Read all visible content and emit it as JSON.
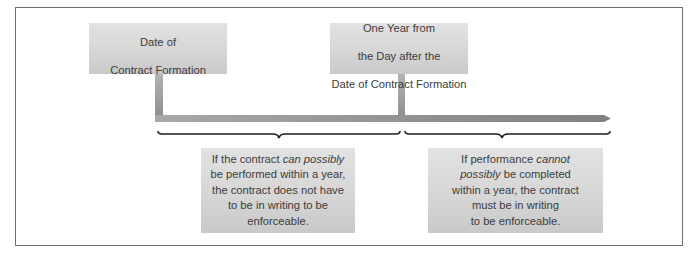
{
  "diagram": {
    "colors": {
      "frame_border": "#6e6e6e",
      "box_fill_top": "#e2e2e2",
      "box_fill_bottom": "#c9c9c9",
      "timeline": "#8c8c8c",
      "brace": "#1e1e1e",
      "text": "#3c3c3c"
    },
    "markers": [
      {
        "id": "start",
        "lines": [
          "Date of",
          "Contract Formation"
        ]
      },
      {
        "id": "one-year",
        "lines": [
          "One Year from",
          "the Day after the",
          "Date of Contract Formation"
        ]
      }
    ],
    "outcomes": [
      {
        "id": "within-year",
        "segments": [
          {
            "text": "If the contract ",
            "italic": false
          },
          {
            "text": "can possibly",
            "italic": true
          },
          {
            "text": "\nbe performed within a year,\nthe contract does not have\nto be in writing to be\nenforceable.",
            "italic": false
          }
        ]
      },
      {
        "id": "beyond-year",
        "segments": [
          {
            "text": "If performance ",
            "italic": false
          },
          {
            "text": "cannot\npossibly",
            "italic": true
          },
          {
            "text": " be completed\nwithin a year, the contract\nmust be in writing\nto be enforceable.",
            "italic": false
          }
        ]
      }
    ]
  }
}
